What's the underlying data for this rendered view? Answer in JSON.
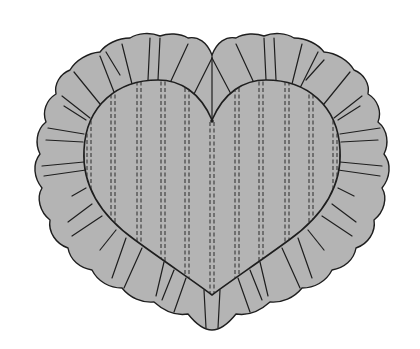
{
  "illustration": {
    "subject": "heart-shaped ruffled pillow",
    "colors": {
      "background": "#ffffff",
      "fabric": "#b4b4b4",
      "outline": "#1e1e1e",
      "stitch": "#2a2a2a"
    },
    "stitch_columns_x": [
      89,
      113,
      139,
      163,
      212,
      237,
      261,
      287,
      311
    ]
  }
}
